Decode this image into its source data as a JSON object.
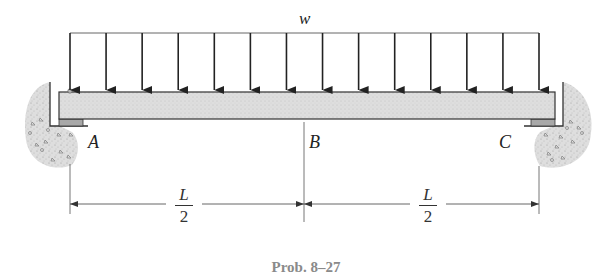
{
  "figure": {
    "load_label": "w",
    "support_labels": {
      "left": "A",
      "middle": "B",
      "right": "C"
    },
    "dimensions": [
      {
        "numerator": "L",
        "denominator": "2"
      },
      {
        "numerator": "L",
        "denominator": "2"
      }
    ],
    "caption": "Prob. 8–27",
    "arrow_count": 14,
    "colors": {
      "beam_fill": "#d9d9d9",
      "line": "#333333",
      "soil": "#cfcfcf",
      "caption": "#8a8a8a"
    }
  }
}
